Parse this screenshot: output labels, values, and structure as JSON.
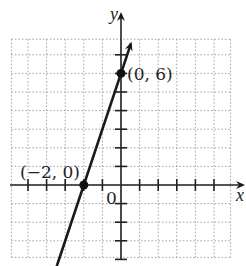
{
  "diagram": {
    "type": "coordinate-plane-line",
    "axes": {
      "x_label": "x",
      "y_label": "y",
      "origin_label": "0"
    },
    "grid": {
      "x_range": [
        -6,
        6
      ],
      "y_range": [
        -4,
        8
      ],
      "unit": 1,
      "style": "dotted"
    },
    "line": {
      "equation": "y = 3x + 6",
      "slope": 3,
      "intercept": 6,
      "arrows": "both"
    },
    "points": [
      {
        "x": 0,
        "y": 6,
        "label": "(0, 6)"
      },
      {
        "x": -2,
        "y": 0,
        "label": "(−2, 0)"
      }
    ]
  },
  "colors": {
    "line": "#1a1a1a",
    "grid": "#9a9a9a",
    "axis": "#222222"
  }
}
